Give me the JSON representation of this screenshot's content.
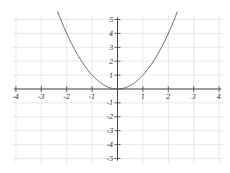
{
  "chart_data": {
    "type": "line",
    "title": "",
    "xlabel": "",
    "ylabel": "",
    "function": "y = x^2",
    "series": [
      {
        "name": "y = x^2",
        "x": [
          -2.24,
          -2,
          -1.5,
          -1,
          -0.5,
          0,
          0.5,
          1,
          1.5,
          2,
          2.24
        ],
        "y": [
          5.0,
          4,
          2.25,
          1,
          0.25,
          0,
          0.25,
          1,
          2.25,
          4,
          5.0
        ]
      }
    ],
    "xlim": [
      -4,
      4
    ],
    "ylim": [
      -5,
      5
    ],
    "x_ticks": [
      -4,
      -3,
      -2,
      -1,
      1,
      2,
      3,
      4
    ],
    "y_ticks": [
      -5,
      -4,
      -3,
      -2,
      -1,
      1,
      2,
      3,
      4,
      5
    ],
    "x_tick_labels": [
      "-4",
      "-3",
      "-2",
      "-1",
      "1",
      "2",
      "3",
      "4"
    ],
    "y_tick_labels": [
      "-5",
      "-4",
      "-3",
      "-2",
      "-1",
      "1",
      "2",
      "3",
      "4",
      "5"
    ],
    "grid": true,
    "legend": null,
    "colors": {
      "curve": "#555555",
      "axis": "#444444",
      "grid": "#d8d8d8"
    }
  }
}
